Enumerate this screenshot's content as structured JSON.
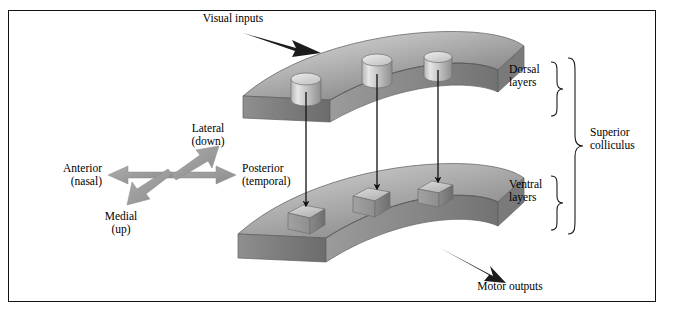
{
  "figure": {
    "domain_title": "Superior colliculus layered map diagram",
    "background": "#ffffff",
    "frame_color": "#111111"
  },
  "labels": {
    "visual_inputs": "Visual inputs",
    "motor_outputs": "Motor outputs",
    "dorsal_layers_line1": "Dorsal",
    "dorsal_layers_line2": "layers",
    "ventral_layers_line1": "Ventral",
    "ventral_layers_line2": "layers",
    "superior_line1": "Superior",
    "superior_line2": "colliculus",
    "lateral_line1": "Lateral",
    "lateral_line2": "(down)",
    "medial_line1": "Medial",
    "medial_line2": "(up)",
    "anterior_line1": "Anterior",
    "anterior_line2": "(nasal)",
    "posterior_line1": "Posterior",
    "posterior_line2": "(temporal)"
  },
  "colors": {
    "slab_top_light": "#d8d8d8",
    "slab_top_mid": "#a8a8a8",
    "slab_top_dark": "#7e7e7e",
    "slab_side": "#8e8e8e",
    "slab_front_dark": "#6f6f6f",
    "cylinder_light": "#e2e2e2",
    "cylinder_dark": "#9a9a9a",
    "box_light": "#c9c9c9",
    "box_dark": "#8a8a8a",
    "arrow_black": "#111111",
    "arrow_gray": "#9a9a9a",
    "brace_stroke": "#1a1a1a",
    "text": "#000000"
  },
  "structures": {
    "dorsal_slab": {
      "name": "dorsal-layers-slab",
      "shape": "curved-arc-plate",
      "cylinder_count": 3
    },
    "ventral_slab": {
      "name": "ventral-layers-slab",
      "shape": "curved-arc-plate",
      "box_count": 3
    },
    "connectors": {
      "count": 3,
      "style": "vertical-black-arrow"
    }
  },
  "compass": {
    "directions": [
      {
        "id": "lateral",
        "label": "Lateral",
        "sub": "(down)",
        "angle_deg": -55
      },
      {
        "id": "posterior",
        "label": "Posterior",
        "sub": "(temporal)",
        "angle_deg": 0
      },
      {
        "id": "medial",
        "label": "Medial",
        "sub": "(up)",
        "angle_deg": 125
      },
      {
        "id": "anterior",
        "label": "Anterior",
        "sub": "(nasal)",
        "angle_deg": 180
      }
    ]
  }
}
